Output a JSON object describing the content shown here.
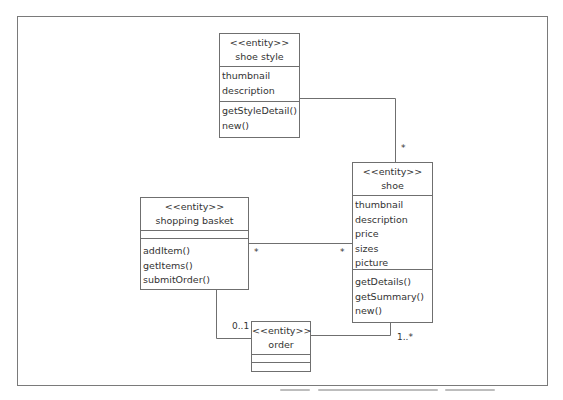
{
  "diagram": {
    "type": "UML class diagram",
    "line_color": "#6f6f6f",
    "classes": {
      "shoe_style": {
        "stereotype": "<<entity>>",
        "name": "shoe style",
        "attributes": [
          "thumbnail",
          "description"
        ],
        "methods": [
          "getStyleDetail()",
          "new()"
        ]
      },
      "shoe": {
        "stereotype": "<<entity>>",
        "name": "shoe",
        "attributes": [
          "thumbnail",
          "description",
          "price",
          "sizes",
          "picture"
        ],
        "methods": [
          "getDetails()",
          "getSummary()",
          "new()"
        ]
      },
      "shopping_basket": {
        "stereotype": "<<entity>>",
        "name": "shopping basket",
        "attributes": [],
        "methods": [
          "addItem()",
          "getItems()",
          "submitOrder()"
        ]
      },
      "order": {
        "stereotype": "<<entity>>",
        "name": "order",
        "attributes": [],
        "methods": []
      }
    },
    "associations": [
      {
        "from": "shoe style",
        "to": "shoe",
        "from_mult": "",
        "to_mult": "*"
      },
      {
        "from": "shopping basket",
        "to": "shoe",
        "from_mult": "*",
        "to_mult": "*"
      },
      {
        "from": "shopping basket",
        "to": "order",
        "from_mult": "",
        "to_mult": "0..1"
      },
      {
        "from": "order",
        "to": "shoe",
        "from_mult": "",
        "to_mult": "1..*"
      }
    ]
  }
}
